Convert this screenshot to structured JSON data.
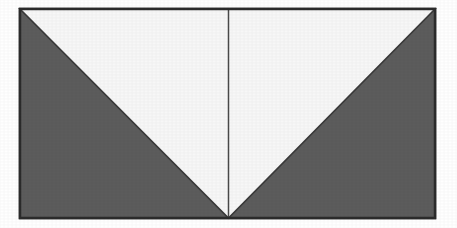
{
  "figure": {
    "title": "Rectangle divided into a white inverted triangle and two dark gray corner triangles",
    "canvas": {
      "width": 457,
      "height": 228,
      "background": "#ffffff"
    },
    "frame": {
      "label": "rectangle-outline",
      "x": 20,
      "y": 9,
      "width": 415,
      "height": 209,
      "fill_color": "#5c5c5c",
      "stroke_color": "#2b2b2b",
      "stroke_width": 2.5
    },
    "shapes": [
      {
        "name": "left-dark-triangle",
        "kind": "triangle",
        "points": "20,9 20,218 228.5,218",
        "fill_color": "#5c5c5c",
        "vertex_labels": [
          "top-left",
          "bottom-left",
          "bottom-center"
        ]
      },
      {
        "name": "right-dark-triangle",
        "kind": "triangle",
        "points": "435,9 435,218 228.5,218",
        "fill_color": "#5c5c5c",
        "vertex_labels": [
          "top-right",
          "bottom-right",
          "bottom-center"
        ]
      },
      {
        "name": "white-inverted-triangle",
        "kind": "triangle",
        "points": "20,9 435,9 228.5,218",
        "fill_color": "#f7f7f7",
        "stroke_color": "#3a3a3a",
        "stroke_width": 1.6,
        "vertex_labels": [
          "top-left",
          "top-right",
          "bottom-center"
        ]
      }
    ],
    "lines": [
      {
        "name": "center-bisector-line",
        "x1": 228.5,
        "y1": 9,
        "x2": 228.5,
        "y2": 218,
        "stroke_color": "#4a4a4a",
        "stroke_width": 1.5
      }
    ],
    "palette": {
      "dark_gray": "#5c5c5c",
      "white_fill": "#f7f7f7",
      "outline": "#2b2b2b",
      "page_background": "#ffffff"
    }
  }
}
